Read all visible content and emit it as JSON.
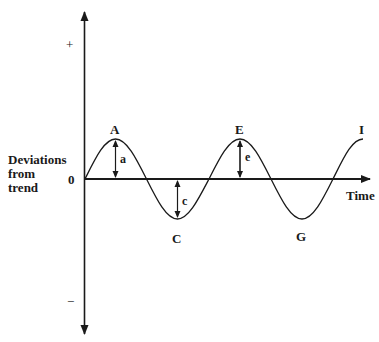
{
  "diagram": {
    "y_axis": {
      "plus_label": "+",
      "minus_label": "−",
      "zero_label": "0",
      "title_lines": [
        "Deviations",
        "from",
        "trend"
      ]
    },
    "x_axis": {
      "label": "Time"
    },
    "points": {
      "A": "A",
      "C": "C",
      "E": "E",
      "G": "G",
      "I": "I"
    },
    "amplitudes": {
      "a": "a",
      "c": "c",
      "e": "e"
    },
    "colors": {
      "ink": "#1a1a1a",
      "background": "#ffffff"
    }
  }
}
